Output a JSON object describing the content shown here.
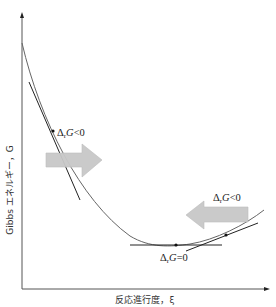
{
  "diagram": {
    "y_axis_label": "Gibbs エネルギー，G",
    "x_axis_label": "反応進行度，ξ",
    "labels": {
      "left_point": "ΔrG<0",
      "right_point": "ΔrG<0",
      "minimum": "ΔrG=0"
    },
    "label_parts": {
      "delta": "Δ",
      "sub_r": "r",
      "G": "G",
      "lt0": "<0",
      "eq0": "=0"
    },
    "arrows": [
      {
        "direction": "right",
        "meaning": "reaction proceeds forward"
      },
      {
        "direction": "left",
        "meaning": "reaction proceeds backward"
      }
    ],
    "colors": {
      "axis": "#555555",
      "curve": "#666666",
      "tangent": "#222222",
      "arrow_fill": "#c8c8c8",
      "arrow_stroke": "#b0b0b0"
    }
  }
}
